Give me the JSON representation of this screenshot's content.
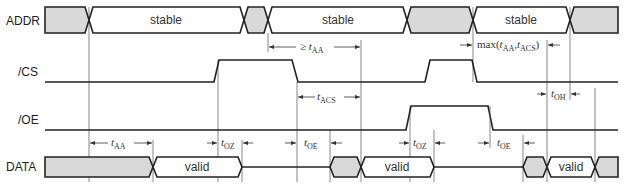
{
  "signals": [
    {
      "name": "ADDR"
    },
    {
      "name": "/CS"
    },
    {
      "name": "/OE"
    },
    {
      "name": "DATA"
    }
  ],
  "addr": {
    "states": [
      "stable",
      "stable",
      "stable"
    ]
  },
  "data": {
    "states": [
      "valid",
      "valid",
      "valid"
    ]
  },
  "timings": {
    "t_aa_min": {
      "prefix": "≥ ",
      "sym": "t",
      "sub": "AA"
    },
    "t_acs": {
      "sym": "t",
      "sub": "ACS"
    },
    "max": {
      "text": "max(",
      "sym1": "t",
      "sub1": "AA",
      "sep": ",",
      "sym2": "t",
      "sub2": "ACS",
      "close": ")"
    },
    "t_oh": {
      "sym": "t",
      "sub": "OH"
    },
    "t_aa": {
      "sym": "t",
      "sub": "AA"
    },
    "t_oz_1": {
      "sym": "t",
      "sub": "OZ"
    },
    "t_oe_1": {
      "sym": "t",
      "sub": "OE"
    },
    "t_oz_2": {
      "sym": "t",
      "sub": "OZ"
    },
    "t_oe_2": {
      "sym": "t",
      "sub": "OE"
    }
  },
  "colors": {
    "undefined_fill": "#d9d9d9",
    "line": "#222222"
  }
}
